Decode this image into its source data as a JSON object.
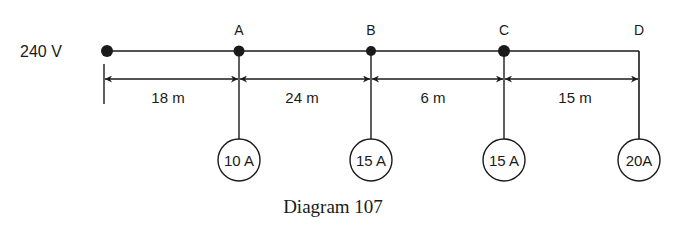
{
  "diagram": {
    "source_label": "240 V",
    "nodes": [
      {
        "id": "A",
        "label": "A",
        "load": "10 A"
      },
      {
        "id": "B",
        "label": "B",
        "load": "15 A"
      },
      {
        "id": "C",
        "label": "C",
        "load": "15 A"
      },
      {
        "id": "D",
        "label": "D",
        "load": "20A"
      }
    ],
    "distances": [
      "18 m",
      "24 m",
      "6 m",
      "15 m"
    ],
    "caption": "Diagram 107"
  },
  "colors": {
    "ink": "#1a1a1a",
    "background": "#ffffff"
  }
}
